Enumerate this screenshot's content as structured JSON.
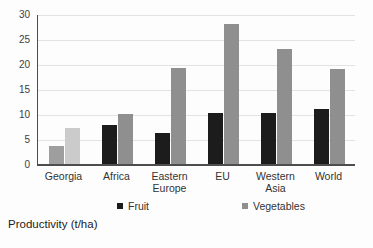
{
  "chart_data": {
    "type": "bar",
    "title": "Productivity (t/ha)",
    "categories": [
      "Georgia",
      "Africa",
      "Eastern Europe",
      "EU",
      "Western Asia",
      "World"
    ],
    "series": [
      {
        "name": "Fruit",
        "color": "#1c1c1c",
        "values": [
          3.8,
          8.0,
          6.4,
          10.4,
          10.5,
          11.2
        ]
      },
      {
        "name": "Vegetables",
        "color": "#8f8f8f",
        "values": [
          7.5,
          10.2,
          19.5,
          28.2,
          23.3,
          19.2
        ]
      }
    ],
    "highlight": {
      "category": "Georgia",
      "series_colors": {
        "Fruit": "#9e9e9e",
        "Vegetables": "#cbcbcb"
      }
    },
    "ylim": [
      0,
      30
    ],
    "yticks": [
      0,
      5,
      10,
      15,
      20,
      25,
      30
    ],
    "grid": true,
    "legend_position": "bottom",
    "axis_color": "#4d4d4d",
    "gridline_color": "#e3e3e3"
  },
  "legend": {
    "items": [
      {
        "label": "Fruit",
        "color": "#1c1c1c"
      },
      {
        "label": "Vegetables",
        "color": "#8f8f8f"
      }
    ]
  },
  "footer": {
    "title": "Productivity (t/ha)"
  }
}
